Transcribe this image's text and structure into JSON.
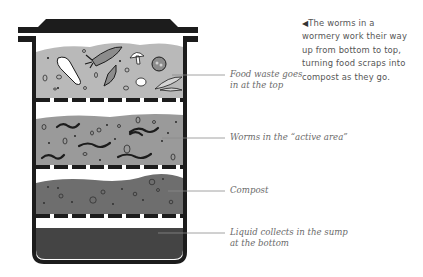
{
  "caption": {
    "pointer": "◀",
    "lines": [
      "The worms in a",
      "wormery work their way",
      "up from bottom to top,",
      "turning food scraps into",
      "compost as they go."
    ]
  },
  "layers": [
    {
      "id": "food-waste",
      "label_lines": [
        "Food waste goes",
        "in at the top"
      ],
      "fill": "#b9b9b9"
    },
    {
      "id": "worms",
      "label_lines": [
        "Worms in the “active area”"
      ],
      "fill": "#9a9a9a"
    },
    {
      "id": "compost",
      "label_lines": [
        "Compost"
      ],
      "fill": "#6e6e6e"
    },
    {
      "id": "sump",
      "label_lines": [
        "Liquid collects in the sump",
        "at the bottom"
      ],
      "fill": "#444444"
    }
  ],
  "colors": {
    "outline": "#1c1c1c",
    "leader_line": "#8a8a8a"
  }
}
